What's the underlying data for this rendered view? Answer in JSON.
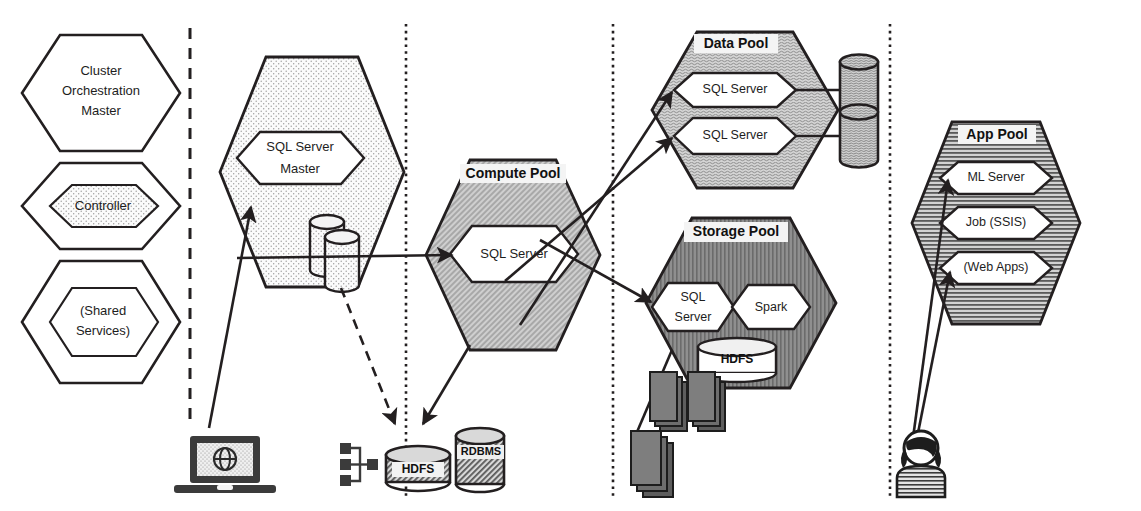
{
  "diagram": {
    "colors": {
      "stroke": "#231f20",
      "dotted_fill": "#f2f2f2",
      "compute_pool_fill": "#bfbfbf",
      "data_pool_fill": "#c9c9c9",
      "storage_pool_fill": "#8c8c8c",
      "app_pool_fill": "#b3b3b3",
      "node_fill": "#ffffff",
      "icon_fill": "#404040"
    },
    "control_plane": {
      "nodes": [
        {
          "id": "cluster-orchestration-master",
          "label": "Cluster\nOrchestration\nMaster",
          "lines": [
            "Cluster",
            "Orchestration",
            "Master"
          ],
          "fill": "none"
        },
        {
          "id": "controller",
          "label": "Controller",
          "lines": [
            "Controller"
          ],
          "fill": "dotted"
        },
        {
          "id": "shared-services",
          "label": "(Shared Services)",
          "lines": [
            "(Shared",
            "Services)"
          ],
          "fill": "none"
        }
      ]
    },
    "master_instance": {
      "pool_fill": "dotted",
      "node": {
        "id": "sql-server-master",
        "lines": [
          "SQL Server",
          "Master"
        ]
      },
      "storage_icon": "database-cylinders"
    },
    "compute_pool": {
      "title": "Compute Pool",
      "fill": "hatch-diagonal",
      "nodes": [
        {
          "id": "compute-sql-server",
          "lines": [
            "SQL Server"
          ]
        }
      ]
    },
    "data_pool": {
      "title": "Data Pool",
      "fill": "noise",
      "nodes": [
        {
          "id": "data-sql-server-1",
          "lines": [
            "SQL Server"
          ]
        },
        {
          "id": "data-sql-server-2",
          "lines": [
            "SQL Server"
          ]
        }
      ],
      "attached_storage": [
        "database-cylinder",
        "database-cylinder"
      ]
    },
    "storage_pool": {
      "title": "Storage Pool",
      "fill": "vertical-lines",
      "nodes": [
        {
          "id": "storage-sql-server",
          "lines": [
            "SQL",
            "Server"
          ]
        },
        {
          "id": "spark",
          "lines": [
            "Spark"
          ]
        }
      ],
      "hdfs": {
        "id": "hdfs-cylinder",
        "label": "HDFS"
      }
    },
    "app_pool": {
      "title": "App Pool",
      "fill": "horizontal-lines",
      "nodes": [
        {
          "id": "ml-server",
          "lines": [
            "ML Server"
          ]
        },
        {
          "id": "job-ssis",
          "lines": [
            "Job (SSIS)"
          ]
        },
        {
          "id": "web-apps",
          "lines": [
            "(Web Apps)"
          ]
        }
      ]
    },
    "external": {
      "laptop": {
        "id": "laptop-globe-icon",
        "label": ""
      },
      "network": {
        "id": "network-tree-icon",
        "label": ""
      },
      "hdfs_store": {
        "id": "hdfs-external-cylinder",
        "label": "HDFS"
      },
      "rdbms_store": {
        "id": "rdbms-external-cylinder",
        "label": "RDBMS"
      },
      "server_stacks": [
        {
          "id": "server-stack-1"
        },
        {
          "id": "server-stack-2"
        },
        {
          "id": "server-stack-3"
        }
      ],
      "user": {
        "id": "user-person-icon",
        "label": ""
      }
    },
    "dividers": [
      {
        "id": "divider-dashed-1",
        "style": "dashed",
        "x": 190
      },
      {
        "id": "divider-dotted-2",
        "style": "dotted",
        "x": 406
      },
      {
        "id": "divider-dotted-3",
        "style": "dotted",
        "x": 613
      },
      {
        "id": "divider-dotted-4",
        "style": "dotted",
        "x": 890
      }
    ],
    "connections": [
      {
        "id": "laptop-to-master",
        "from": "laptop-globe-icon",
        "to": "sql-server-master",
        "style": "solid-arrow"
      },
      {
        "id": "master-to-compute",
        "from": "sql-server-master",
        "to": "compute-sql-server",
        "style": "solid-arrow"
      },
      {
        "id": "master-to-external-store",
        "from": "sql-server-master",
        "to": "hdfs-external-cylinder",
        "style": "dashed-arrow"
      },
      {
        "id": "compute-to-data-1",
        "from": "compute-sql-server",
        "to": "data-sql-server-1",
        "style": "solid-arrow"
      },
      {
        "id": "compute-to-data-2",
        "from": "compute-sql-server",
        "to": "data-sql-server-2",
        "style": "solid-arrow"
      },
      {
        "id": "compute-to-storage",
        "from": "compute-sql-server",
        "to": "storage-sql-server",
        "style": "solid-arrow"
      },
      {
        "id": "compute-to-external",
        "from": "compute-sql-server",
        "to": "network-tree-icon",
        "style": "solid-arrow"
      },
      {
        "id": "storage-to-nodes",
        "from": "storage-pool",
        "to": "server-stack-3",
        "style": "solid"
      },
      {
        "id": "user-to-ml-server",
        "from": "user-person-icon",
        "to": "ml-server",
        "style": "solid-arrow"
      },
      {
        "id": "user-to-web-apps",
        "from": "user-person-icon",
        "to": "web-apps",
        "style": "solid-arrow"
      },
      {
        "id": "data-1-to-cylinder",
        "from": "data-sql-server-1",
        "to": "data-cylinder-1",
        "style": "solid"
      },
      {
        "id": "data-2-to-cylinder",
        "from": "data-sql-server-2",
        "to": "data-cylinder-2",
        "style": "solid"
      }
    ]
  }
}
